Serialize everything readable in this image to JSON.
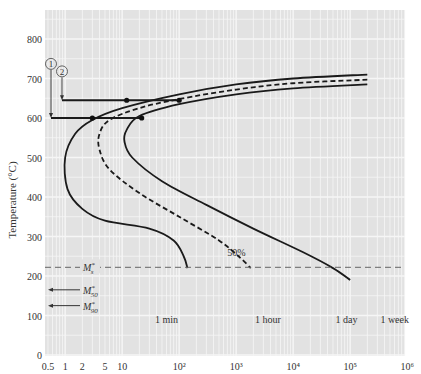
{
  "chart_data": {
    "type": "line",
    "title": "",
    "xlabel": "Time (s, log scale)",
    "ylabel": "Temperature (°C)",
    "xscale": "log",
    "xlim": [
      0.5,
      1000000
    ],
    "ylim": [
      0,
      850
    ],
    "grid": true,
    "x_ticks": [
      "0.5",
      "1",
      "2",
      "5",
      "10",
      "10²",
      "10³",
      "10⁴",
      "10⁵",
      "10⁶"
    ],
    "x_tick_values": [
      0.5,
      1,
      2,
      5,
      10,
      100,
      1000,
      10000,
      100000,
      1000000
    ],
    "y_ticks": [
      "0",
      "100",
      "200",
      "300",
      "400",
      "500",
      "600",
      "700",
      "800"
    ],
    "y_tick_values": [
      0,
      100,
      200,
      300,
      400,
      500,
      600,
      700,
      800
    ],
    "time_markers": [
      {
        "label": "1 min",
        "t": 60
      },
      {
        "label": "1 hour",
        "t": 3600
      },
      {
        "label": "1 day",
        "t": 86400
      },
      {
        "label": "1 week",
        "t": 604800
      }
    ],
    "series": [
      {
        "name": "Start of transformation",
        "style": "solid",
        "points": [
          [
            200000,
            710
          ],
          [
            10000,
            700
          ],
          [
            1000,
            685
          ],
          [
            100,
            660
          ],
          [
            10,
            625
          ],
          [
            3,
            595
          ],
          [
            1.5,
            560
          ],
          [
            1,
            500
          ],
          [
            1.1,
            420
          ],
          [
            2,
            370
          ],
          [
            5,
            340
          ],
          [
            30,
            320
          ],
          [
            80,
            290
          ],
          [
            120,
            250
          ],
          [
            140,
            220
          ]
        ]
      },
      {
        "name": "50% transformation",
        "style": "dashed",
        "points": [
          [
            200000,
            697
          ],
          [
            10000,
            688
          ],
          [
            1000,
            672
          ],
          [
            100,
            648
          ],
          [
            20,
            625
          ],
          [
            6,
            595
          ],
          [
            4,
            560
          ],
          [
            4,
            520
          ],
          [
            6,
            470
          ],
          [
            20,
            410
          ],
          [
            100,
            350
          ],
          [
            500,
            290
          ],
          [
            1200,
            245
          ],
          [
            1800,
            220
          ]
        ]
      },
      {
        "name": "End of transformation",
        "style": "solid",
        "points": [
          [
            200000,
            685
          ],
          [
            10000,
            675
          ],
          [
            1000,
            660
          ],
          [
            100,
            635
          ],
          [
            20,
            605
          ],
          [
            12,
            570
          ],
          [
            11,
            540
          ],
          [
            15,
            500
          ],
          [
            50,
            440
          ],
          [
            300,
            380
          ],
          [
            2000,
            320
          ],
          [
            15000,
            260
          ],
          [
            50000,
            220
          ],
          [
            100000,
            190
          ]
        ]
      }
    ],
    "horizontal_lines": [
      {
        "label": "M*s",
        "y": 222,
        "style": "dashed"
      }
    ],
    "arrows": [
      {
        "label": "M*50",
        "y": 165
      },
      {
        "label": "M*90",
        "y": 125
      }
    ],
    "paths": [
      {
        "label": "1",
        "quench_to": 600,
        "start_t": 1,
        "dots_t": [
          3,
          22
        ],
        "end_t": 22
      },
      {
        "label": "2",
        "quench_to": 645,
        "start_t": 1.1,
        "dots_t": [
          12,
          100
        ],
        "end_t": 100
      }
    ],
    "annotations": [
      {
        "text": "50%",
        "t": 700,
        "T": 250
      }
    ]
  },
  "labels": {
    "ylabel": "Temperature (°C)",
    "ms": "M",
    "ms_sup": "*",
    "ms_sub": "s",
    "m50_sub": "50",
    "m90_sub": "90",
    "pct50": "50%",
    "path1": "1",
    "path2": "2"
  }
}
